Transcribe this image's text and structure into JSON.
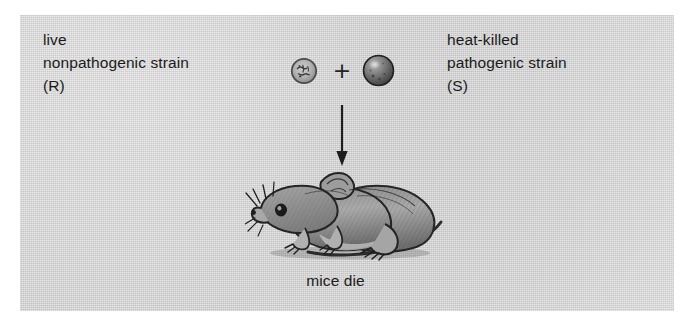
{
  "figure": {
    "name": "griffith-transformation-experiment",
    "panel_background_color": "#d2d2d2",
    "page_background_color": "#ffffff",
    "ink_color": "#1b1b1b"
  },
  "left_label": {
    "line1": "live",
    "line2": "nonpathogenic strain",
    "line3": "(R)"
  },
  "right_label": {
    "line1": "heat-killed",
    "line2": "pathogenic strain",
    "line3": "(S)"
  },
  "operator": {
    "plus": "+"
  },
  "cells": {
    "rough": {
      "icon": "rough-bacterial-cell-icon",
      "strain": "R",
      "appearance": "rough, lightly shaded irregular colony"
    },
    "smooth": {
      "icon": "smooth-bacterial-cell-icon",
      "strain": "S",
      "appearance": "dark smooth sphere with highlight"
    }
  },
  "arrow": {
    "icon": "down-arrow-icon",
    "direction": "down"
  },
  "mouse": {
    "icon": "dead-mouse-illustration",
    "description": "line-drawn mouse lying on its side facing left"
  },
  "caption": {
    "text": "mice die"
  }
}
